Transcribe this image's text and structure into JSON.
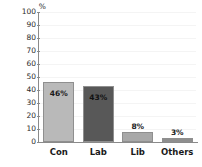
{
  "chart_data": {
    "type": "bar",
    "title": "",
    "subtitle": "",
    "xlabel": "",
    "ylabel": "%",
    "unit_label": "%",
    "categories": [
      "Con",
      "Lab",
      "Lib",
      "Others"
    ],
    "values": [
      46,
      43,
      8,
      3
    ],
    "data_labels": [
      "46%",
      "43%",
      "8%",
      "3%"
    ],
    "ylim": [
      0,
      100
    ],
    "ytick_values": [
      100,
      90,
      80,
      70,
      60,
      50,
      40,
      30,
      20,
      10,
      0
    ],
    "ytick_labels": [
      "100",
      "90",
      "80",
      "70",
      "60",
      "50",
      "40",
      "30",
      "20",
      "10",
      "0"
    ],
    "grid": true,
    "legend": false,
    "legend_position": "none",
    "bar_colors": [
      "#b9b9b9",
      "#585858",
      "#a8a8a8",
      "#8e8e8e"
    ],
    "bar_border_color": "#8f8f8f",
    "axis_color": "#8a8a8a",
    "grid_color": "#f4f4f4",
    "background_color": "#ffffff",
    "text_color": "#1a1a1a",
    "label_placement": [
      "inside",
      "inside",
      "above",
      "above"
    ]
  }
}
